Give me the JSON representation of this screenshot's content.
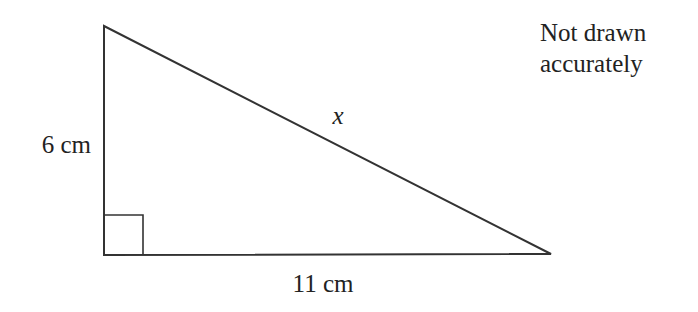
{
  "diagram": {
    "type": "right-triangle",
    "labels": {
      "vertical_side": "6 cm",
      "horizontal_side": "11 cm",
      "hypotenuse": "x"
    },
    "note_lines": [
      "Not drawn",
      "accurately"
    ],
    "stroke_color": "#333333"
  }
}
